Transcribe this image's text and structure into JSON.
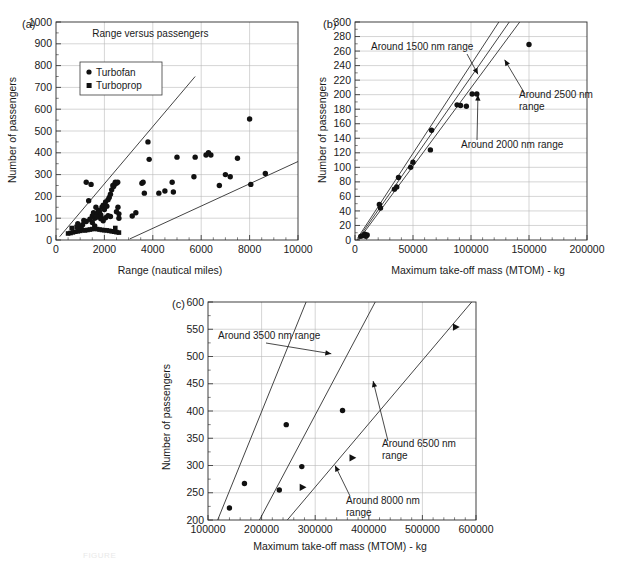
{
  "figure": {
    "panels": [
      "(a)",
      "(b)",
      "(c)"
    ],
    "caption_faint": "FIGURE"
  },
  "panel_a": {
    "label": "(a)",
    "title": "Range versus passengers",
    "legend": [
      {
        "marker": "circle",
        "label": "Turbofan"
      },
      {
        "marker": "square",
        "label": "Turboprop"
      }
    ]
  },
  "panel_b": {
    "label": "(b)",
    "annotations": [
      "Around 1500 nm range",
      "Around 2500 nm\nrange",
      "Around 2000 nm range"
    ]
  },
  "panel_c": {
    "label": "(c)",
    "annotations": [
      "Around 3500 nm range",
      "Around 6500 nm\nrange",
      "Around 8000 nm\nrange"
    ]
  },
  "chart_data": [
    {
      "type": "scatter",
      "panel": "(a)",
      "title": "Range versus passengers",
      "xlabel": "Range (nautical miles)",
      "ylabel": "Number of passengers",
      "xlim": [
        0,
        10000
      ],
      "ylim": [
        0,
        1000
      ],
      "xticks": [
        0,
        2000,
        4000,
        6000,
        8000,
        10000
      ],
      "yticks": [
        0,
        100,
        200,
        300,
        400,
        500,
        600,
        700,
        800,
        900,
        1000
      ],
      "grid": true,
      "legend": [
        "Turbofan",
        "Turboprop"
      ],
      "legend_position": "upper-left-inside",
      "series": [
        {
          "name": "Turbofan",
          "marker": "circle",
          "points": [
            [
              1350,
              180
            ],
            [
              1500,
              110
            ],
            [
              1550,
              125
            ],
            [
              1600,
              100
            ],
            [
              1650,
              150
            ],
            [
              1700,
              120
            ],
            [
              1750,
              135
            ],
            [
              1800,
              130
            ],
            [
              1850,
              115
            ],
            [
              1900,
              150
            ],
            [
              1950,
              160
            ],
            [
              2000,
              140
            ],
            [
              2050,
              175
            ],
            [
              2100,
              155
            ],
            [
              2150,
              185
            ],
            [
              2200,
              195
            ],
            [
              2250,
              210
            ],
            [
              2300,
              230
            ],
            [
              2350,
              250
            ],
            [
              2380,
              245
            ],
            [
              2420,
              255
            ],
            [
              2450,
              265
            ],
            [
              2500,
              260
            ],
            [
              2550,
              265
            ],
            [
              2560,
              150
            ],
            [
              2600,
              120
            ],
            [
              1150,
              90
            ],
            [
              1250,
              85
            ],
            [
              900,
              75
            ],
            [
              1000,
              60
            ],
            [
              1100,
              70
            ],
            [
              1400,
              95
            ],
            [
              1500,
              80
            ],
            [
              1600,
              65
            ],
            [
              1700,
              105
            ],
            [
              1850,
              98
            ],
            [
              2050,
              102
            ],
            [
              2150,
              112
            ],
            [
              1950,
              88
            ],
            [
              2250,
              108
            ],
            [
              1250,
              265
            ],
            [
              1450,
              255
            ],
            [
              2500,
              130
            ],
            [
              2600,
              100
            ],
            [
              3150,
              110
            ],
            [
              3300,
              125
            ],
            [
              3550,
              260
            ],
            [
              3600,
              265
            ],
            [
              3650,
              215
            ],
            [
              3800,
              450
            ],
            [
              3850,
              370
            ],
            [
              4250,
              215
            ],
            [
              4500,
              225
            ],
            [
              4800,
              265
            ],
            [
              4850,
              220
            ],
            [
              5000,
              380
            ],
            [
              5700,
              290
            ],
            [
              5750,
              380
            ],
            [
              6200,
              390
            ],
            [
              6300,
              400
            ],
            [
              6400,
              390
            ],
            [
              6750,
              250
            ],
            [
              7000,
              300
            ],
            [
              7200,
              290
            ],
            [
              7500,
              375
            ],
            [
              8000,
              555
            ],
            [
              8050,
              255
            ],
            [
              8650,
              305
            ]
          ]
        },
        {
          "name": "Turboprop",
          "marker": "square",
          "points": [
            [
              500,
              30
            ],
            [
              600,
              32
            ],
            [
              700,
              35
            ],
            [
              800,
              38
            ],
            [
              900,
              40
            ],
            [
              1000,
              42
            ],
            [
              1100,
              45
            ],
            [
              1200,
              44
            ],
            [
              1300,
              46
            ],
            [
              1400,
              48
            ],
            [
              1500,
              50
            ],
            [
              1600,
              52
            ],
            [
              1700,
              50
            ],
            [
              1800,
              48
            ],
            [
              1900,
              46
            ],
            [
              2000,
              45
            ],
            [
              2100,
              44
            ],
            [
              2200,
              42
            ],
            [
              2300,
              40
            ],
            [
              2400,
              38
            ],
            [
              2500,
              36
            ],
            [
              2600,
              34
            ],
            [
              650,
              55
            ],
            [
              850,
              60
            ],
            [
              1050,
              58
            ],
            [
              2450,
              55
            ]
          ]
        }
      ],
      "trend_lines": [
        {
          "name": "upper-bound",
          "from": [
            150,
            15
          ],
          "to": [
            5750,
            750
          ]
        },
        {
          "name": "lower-bound",
          "from": [
            3050,
            5
          ],
          "to": [
            10000,
            360
          ]
        }
      ]
    },
    {
      "type": "scatter",
      "panel": "(b)",
      "xlabel": "Maximum take-off mass (MTOM) - kg",
      "ylabel": "Number of passengers",
      "xlim": [
        0,
        200000
      ],
      "ylim": [
        0,
        300
      ],
      "xticks": [
        0,
        50000,
        100000,
        150000,
        200000
      ],
      "yticks": [
        0,
        20,
        40,
        60,
        80,
        100,
        120,
        140,
        160,
        180,
        200,
        220,
        240,
        260,
        280,
        300
      ],
      "grid": true,
      "annotations": [
        {
          "text": "Around 1500 nm range",
          "points_to": [
            106000,
            228
          ]
        },
        {
          "text": "Around 2500 nm range",
          "points_to": [
            129000,
            248
          ]
        },
        {
          "text": "Around 2000 nm range",
          "points_to": [
            106000,
            200
          ]
        }
      ],
      "series": [
        {
          "name": "aircraft",
          "marker": "circle",
          "points": [
            [
              5000,
              5
            ],
            [
              7000,
              6
            ],
            [
              8500,
              8
            ],
            [
              9500,
              5
            ],
            [
              10500,
              7
            ],
            [
              21000,
              49
            ],
            [
              22000,
              44
            ],
            [
              34000,
              70
            ],
            [
              36000,
              73
            ],
            [
              37500,
              86
            ],
            [
              48000,
              100
            ],
            [
              50000,
              107
            ],
            [
              65000,
              124
            ],
            [
              66000,
              151
            ],
            [
              88000,
              186
            ],
            [
              91000,
              185
            ],
            [
              96000,
              184
            ],
            [
              101000,
              201
            ],
            [
              105000,
              201
            ],
            [
              150000,
              269
            ]
          ]
        }
      ],
      "trend_lines": [
        {
          "name": "Around 1500 nm range",
          "from": [
            2000,
            2
          ],
          "to": [
            124000,
            300
          ]
        },
        {
          "name": "Around 2000 nm range",
          "from": [
            2000,
            0
          ],
          "to": [
            133000,
            300
          ]
        },
        {
          "name": "Around 2500 nm range",
          "from": [
            3000,
            0
          ],
          "to": [
            142000,
            300
          ]
        }
      ]
    },
    {
      "type": "scatter",
      "panel": "(c)",
      "xlabel": "Maximum take-off mass (MTOM) - kg",
      "ylabel": "Number of passengers",
      "xlim": [
        100000,
        600000
      ],
      "ylim": [
        200,
        600
      ],
      "xticks": [
        100000,
        200000,
        300000,
        400000,
        500000,
        600000
      ],
      "yticks": [
        200,
        250,
        300,
        350,
        400,
        450,
        500,
        550,
        600
      ],
      "grid": true,
      "annotations": [
        {
          "text": "Around 3500 nm range",
          "points_to": [
            330000,
            505
          ]
        },
        {
          "text": "Around 6500 nm range",
          "points_to": [
            408000,
            455
          ]
        },
        {
          "text": "Around 8000 nm range",
          "points_to": [
            337000,
            300
          ]
        }
      ],
      "series": [
        {
          "name": "circle-markers",
          "marker": "circle",
          "points": [
            [
              140000,
              222
            ],
            [
              168000,
              267
            ],
            [
              233000,
              255
            ],
            [
              246000,
              375
            ],
            [
              275000,
              298
            ],
            [
              351000,
              401
            ]
          ]
        },
        {
          "name": "triangle-markers",
          "marker": "triangle-right",
          "points": [
            [
              277000,
              260
            ],
            [
              370000,
              314
            ],
            [
              563000,
              554
            ]
          ]
        }
      ],
      "trend_lines": [
        {
          "name": "Around 3500 nm range",
          "from": [
            118000,
            200
          ],
          "to": [
            283000,
            600
          ]
        },
        {
          "name": "Around 6500 nm range",
          "from": [
            196000,
            200
          ],
          "to": [
            412000,
            600
          ]
        },
        {
          "name": "Around 8000 nm range",
          "from": [
            248000,
            200
          ],
          "to": [
            592000,
            600
          ]
        }
      ]
    }
  ]
}
